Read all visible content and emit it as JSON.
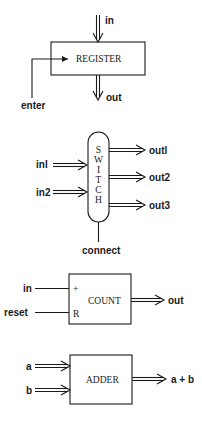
{
  "diagrams": {
    "register": {
      "title": "REGISTER",
      "input_label": "in",
      "output_label": "out",
      "control_label": "enter"
    },
    "switch": {
      "title_letters": [
        "S",
        "W",
        "I",
        "T",
        "C",
        "H"
      ],
      "inputs": [
        "inl",
        "in2"
      ],
      "outputs": [
        "outl",
        "out2",
        "out3"
      ],
      "control_label": "connect"
    },
    "count": {
      "title": "COUNT",
      "inputs": [
        "in",
        "reset"
      ],
      "port_labels": [
        "+",
        "R"
      ],
      "output_label": "out"
    },
    "adder": {
      "title": "ADDER",
      "inputs": [
        "a",
        "b"
      ],
      "output_label": "a + b"
    }
  }
}
